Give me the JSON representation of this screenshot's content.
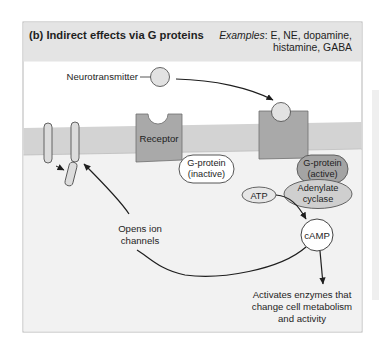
{
  "figure": {
    "title": "(b) Indirect effects via G proteins",
    "examples_label": "Examples",
    "examples_line1": ": E, NE, dopamine,",
    "examples_line2": "histamine, GABA"
  },
  "labels": {
    "neurotransmitter": "Neurotransmitter",
    "receptor": "Receptor",
    "gprotein_inactive_line1": "G-protein",
    "gprotein_inactive_line2": "(inactive)",
    "gprotein_active_line1": "G-protein",
    "gprotein_active_line2": "(active)",
    "adenylate_line1": "Adenylate",
    "adenylate_line2": "cyclase",
    "atp": "ATP",
    "camp": "cAMP",
    "opens_line1": "Opens ion",
    "opens_line2": "channels",
    "activates_line1": "Activates enzymes that",
    "activates_line2": "change cell metabolism",
    "activates_line3": "and activity"
  },
  "colors": {
    "header_bg": "#e4e4e4",
    "frame_border": "#b5b5b5",
    "panel_bg": "#ffffff",
    "cytoplasm_bg": "#f2f2f2",
    "membrane": "#d3d3d3",
    "receptor": "#a9a9a9",
    "gprotein_active": "#a4a4a4",
    "adenylate": "#cfcfcf",
    "ligand": "#e2e2e2",
    "arrow": "#1e1e1e"
  }
}
